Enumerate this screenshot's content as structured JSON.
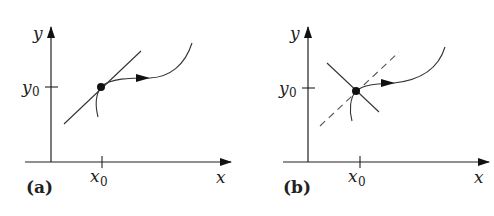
{
  "panels": [
    {
      "id": "a",
      "label": "(a)",
      "x_axis_label": "x",
      "y_axis_label": "y",
      "x_tick_label": "x",
      "x_tick_sub": "0",
      "y_tick_label": "y",
      "y_tick_sub": "0",
      "description": "Trajectory through equilibrium point tangent to a single solid line"
    },
    {
      "id": "b",
      "label": "(b)",
      "x_axis_label": "x",
      "y_axis_label": "y",
      "x_tick_label": "x",
      "x_tick_sub": "0",
      "y_tick_label": "y",
      "y_tick_sub": "0",
      "description": "Trajectory through point with crossing solid line and dashed line"
    }
  ],
  "colors": {
    "stroke": "#222222",
    "curve": "#333333"
  }
}
